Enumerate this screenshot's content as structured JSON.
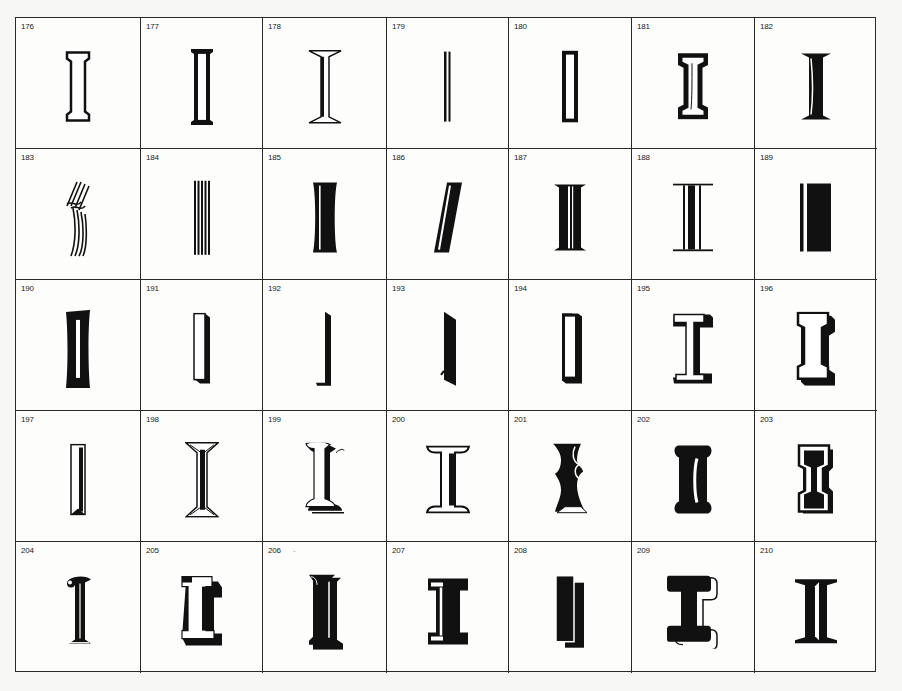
{
  "page": {
    "background": "#f7f7f6",
    "ink": "#111111"
  },
  "specimens": [
    {
      "number": "176",
      "style": "outline-serif"
    },
    {
      "number": "177",
      "style": "inline-bar"
    },
    {
      "number": "178",
      "style": "flared-shaded"
    },
    {
      "number": "179",
      "style": "thin-double-line"
    },
    {
      "number": "180",
      "style": "outline-rect-heavy"
    },
    {
      "number": "181",
      "style": "heavy-outline-serif"
    },
    {
      "number": "182",
      "style": "bold-roman-highlight"
    },
    {
      "number": "183",
      "style": "multiline-script"
    },
    {
      "number": "184",
      "style": "five-line-stripes"
    },
    {
      "number": "185",
      "style": "bold-concave-inline"
    },
    {
      "number": "186",
      "style": "italic-inline"
    },
    {
      "number": "187",
      "style": "bold-split-inline"
    },
    {
      "number": "188",
      "style": "triple-line-slab"
    },
    {
      "number": "189",
      "style": "bar-with-rule"
    },
    {
      "number": "190",
      "style": "concave-black-inline"
    },
    {
      "number": "191",
      "style": "3d-outline-bar"
    },
    {
      "number": "192",
      "style": "shadow-only-bar"
    },
    {
      "number": "193",
      "style": "shadow-slant-bar"
    },
    {
      "number": "194",
      "style": "bracket-shadow"
    },
    {
      "number": "195",
      "style": "shadow-serif-open"
    },
    {
      "number": "196",
      "style": "3d-slab-outline"
    },
    {
      "number": "197",
      "style": "bevel-bar"
    },
    {
      "number": "198",
      "style": "engraved-flared"
    },
    {
      "number": "199",
      "style": "ornate-shadow"
    },
    {
      "number": "200",
      "style": "flared-shaded-open"
    },
    {
      "number": "201",
      "style": "tuscan-shadow"
    },
    {
      "number": "202",
      "style": "rounded-bone-inline"
    },
    {
      "number": "203",
      "style": "collegiate-outline"
    },
    {
      "number": "204",
      "style": "ornate-ball-terminal"
    },
    {
      "number": "205",
      "style": "3d-block-slab"
    },
    {
      "number": "206",
      "style": "black-shadow-serif",
      "mark": "-"
    },
    {
      "number": "207",
      "style": "slab-inline-bold"
    },
    {
      "number": "208",
      "style": "offset-double-bar"
    },
    {
      "number": "209",
      "style": "bold-slab-outline-shadow"
    },
    {
      "number": "210",
      "style": "bold-didone-inline"
    }
  ]
}
